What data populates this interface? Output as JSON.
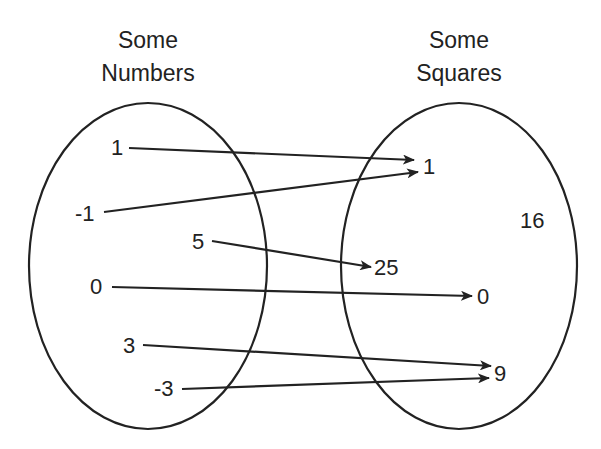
{
  "diagram": {
    "type": "mapping",
    "left_set": {
      "title_line1": "Some",
      "title_line2": "Numbers",
      "elements": [
        "1",
        "-1",
        "5",
        "0",
        "3",
        "-3"
      ]
    },
    "right_set": {
      "title_line1": "Some",
      "title_line2": "Squares",
      "elements": [
        "1",
        "16",
        "25",
        "0",
        "9"
      ]
    },
    "mappings": [
      {
        "from": "1",
        "to": "1"
      },
      {
        "from": "-1",
        "to": "1"
      },
      {
        "from": "5",
        "to": "25"
      },
      {
        "from": "0",
        "to": "0"
      },
      {
        "from": "3",
        "to": "9"
      },
      {
        "from": "-3",
        "to": "9"
      }
    ],
    "colors": {
      "stroke": "#222222",
      "background": "#ffffff"
    }
  }
}
